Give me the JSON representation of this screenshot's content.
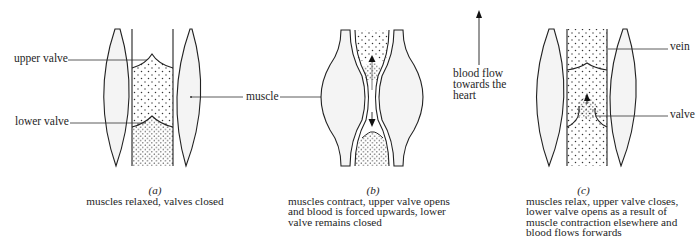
{
  "labels": {
    "upper_valve": "upper valve",
    "lower_valve": "lower valve",
    "muscle": "muscle",
    "blood_flow_line1": "blood flow",
    "blood_flow_line2": "towards the",
    "blood_flow_line3": "heart",
    "vein": "vein",
    "valve": "valve"
  },
  "panels": [
    {
      "id": "(a)",
      "caption_lines": [
        "muscles relaxed, valves closed"
      ]
    },
    {
      "id": "(b)",
      "caption_lines": [
        "muscles contract, upper valve opens",
        "and blood is forced upwards, lower",
        "valve remains closed"
      ]
    },
    {
      "id": "(c)",
      "caption_lines": [
        "muscles relax, upper valve closes,",
        "lower valve opens as a result of",
        "muscle contraction elsewhere and",
        "blood flows forwards"
      ]
    }
  ],
  "icons": {
    "flow_arrow": "arrow-up-icon"
  }
}
